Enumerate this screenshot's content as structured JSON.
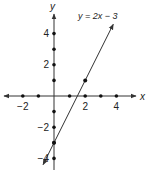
{
  "chart_data": {
    "type": "line",
    "title": "",
    "equation_label": "y = 2x − 3",
    "xlabel": "x",
    "ylabel": "y",
    "xlim": [
      -3,
      5
    ],
    "ylim": [
      -4.5,
      5
    ],
    "x_tick_labels": [
      {
        "value": -2,
        "label": "−2"
      },
      {
        "value": 2,
        "label": "2"
      },
      {
        "value": 4,
        "label": "4"
      }
    ],
    "y_tick_labels": [
      {
        "value": 4,
        "label": "4"
      },
      {
        "value": 2,
        "label": "2"
      },
      {
        "value": -2,
        "label": "−2"
      },
      {
        "value": -4,
        "label": "−4"
      }
    ],
    "x_tick_dots": [
      -2,
      -1,
      1,
      2,
      3,
      4
    ],
    "y_tick_dots": [
      4,
      3,
      2,
      1,
      -1,
      -2,
      -3,
      -4
    ],
    "series": [
      {
        "name": "y = 2x − 3",
        "slope": 2,
        "intercept": -3,
        "x_range": [
          -0.7,
          3.8
        ],
        "highlighted_points": [
          [
            0,
            -3
          ],
          [
            2,
            1
          ]
        ]
      }
    ],
    "grid": false,
    "arrows": true
  },
  "layout": {
    "origin_px": [
      54,
      96
    ],
    "unit_px": 15.6
  }
}
